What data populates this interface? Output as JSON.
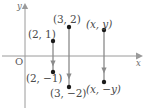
{
  "figure": {
    "background": "#ffffff",
    "axis_color": "#9a9a9a",
    "segment_color": "#8a8a8a",
    "point_color": "#1a1a1a",
    "text_color": "#4a4a4a"
  },
  "axes": {
    "x_axis_label": "x",
    "y_axis_label": "y",
    "origin_label": "O",
    "x_axis_y_px": 56,
    "y_axis_x_px": 25
  },
  "points": [
    {
      "label": "(2, 1)",
      "x_px": 53,
      "y_px": 41,
      "label_x_px": 28,
      "label_y_px": 29
    },
    {
      "label": "(2, −1)",
      "x_px": 53,
      "y_px": 72,
      "label_x_px": 26,
      "label_y_px": 73
    },
    {
      "label": "(3, 2)",
      "x_px": 69,
      "y_px": 27,
      "label_x_px": 53,
      "label_y_px": 14
    },
    {
      "label": "(3, −2)",
      "x_px": 69,
      "y_px": 87,
      "label_x_px": 50,
      "label_y_px": 88
    },
    {
      "label": "(x, y)",
      "x_px": 104,
      "y_px": 30,
      "label_x_px": 86,
      "label_y_px": 19
    },
    {
      "label": "(x, −y)",
      "x_px": 104,
      "y_px": 82,
      "label_x_px": 86,
      "label_y_px": 84
    }
  ],
  "segments": [
    {
      "name": "segment-2",
      "x_px": 53,
      "top_y_px": 41,
      "bottom_y_px": 72,
      "arrow_y_px": 63
    },
    {
      "name": "segment-3",
      "x_px": 69,
      "top_y_px": 27,
      "bottom_y_px": 87,
      "arrow_y_px": 76
    },
    {
      "name": "segment-xy",
      "x_px": 104,
      "top_y_px": 30,
      "bottom_y_px": 82,
      "arrow_y_px": 70
    }
  ],
  "labels": {
    "point_2_1": "(2, 1)",
    "point_2_neg1": "(2, −1)",
    "point_3_2": "(3, 2)",
    "point_3_neg2": "(3, −2)",
    "point_x_y": "(x, y)",
    "point_x_negy": "(x, −y)"
  }
}
